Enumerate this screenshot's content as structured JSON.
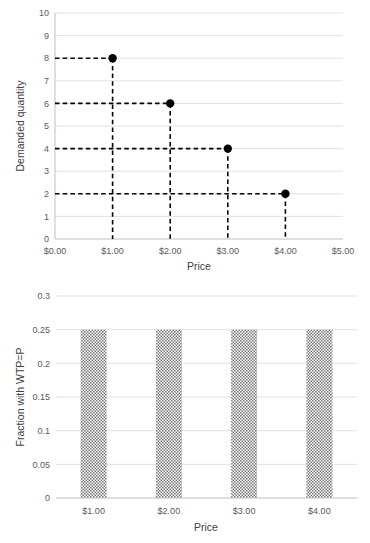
{
  "chart_data": [
    {
      "type": "scatter",
      "id": "demand-curve",
      "title": "",
      "xlabel": "Price",
      "ylabel": "Demanded quantity",
      "x": [
        1,
        2,
        3,
        4
      ],
      "values": [
        8,
        6,
        4,
        2
      ],
      "point_labels": [
        "$1.00",
        "$2.00",
        "$3.00",
        "$4.00"
      ],
      "xlim": [
        0,
        5
      ],
      "ylim": [
        0,
        10
      ],
      "xticks": [
        0,
        1,
        2,
        3,
        4,
        5
      ],
      "xtick_labels": [
        "$0.00",
        "$1.00",
        "$2.00",
        "$3.00",
        "$4.00",
        "$5.00"
      ],
      "yticks": [
        0,
        1,
        2,
        3,
        4,
        5,
        6,
        7,
        8,
        9,
        10
      ],
      "ytick_labels": [
        "0",
        "1",
        "2",
        "3",
        "4",
        "5",
        "6",
        "7",
        "8",
        "9",
        "10"
      ],
      "grid": "horizontal",
      "legend": "none",
      "marker_color": "#000000",
      "guide_line_style": "dashed",
      "guide_line_color": "#000000"
    },
    {
      "type": "bar",
      "id": "wtp-fraction",
      "title": "",
      "xlabel": "Price",
      "ylabel": "Fraction with WTP=P",
      "categories": [
        "$1.00",
        "$2.00",
        "$3.00",
        "$4.00"
      ],
      "values": [
        0.25,
        0.25,
        0.25,
        0.25
      ],
      "ylim": [
        0,
        0.3
      ],
      "yticks": [
        0,
        0.05,
        0.1,
        0.15,
        0.2,
        0.25,
        0.3
      ],
      "ytick_labels": [
        "0",
        "0.05",
        "0.1",
        "0.15",
        "0.2",
        "0.25",
        "0.3"
      ],
      "grid": "horizontal",
      "legend": "none",
      "bar_fill": "#808080",
      "bar_pattern": "checkerboard"
    }
  ],
  "colors": {
    "grid": "#d9d9d9",
    "axis": "#bfbfbf",
    "text": "#595959",
    "marker": "#000000",
    "bar": "#808080",
    "background": "#ffffff"
  }
}
